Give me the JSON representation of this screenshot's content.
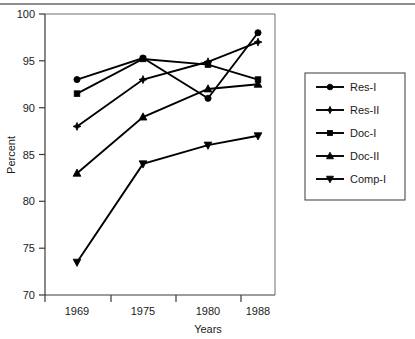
{
  "chart_data": {
    "type": "line",
    "title": "",
    "xlabel": "Years",
    "ylabel": "Percent",
    "categories": [
      "1969",
      "1975",
      "1980",
      "1988"
    ],
    "ylim": [
      70,
      100
    ],
    "yticks": [
      70,
      75,
      80,
      85,
      90,
      95,
      100
    ],
    "grid": false,
    "legend_position": "right-outside",
    "series": [
      {
        "name": "Res-I",
        "marker": "circle",
        "values": [
          93.0,
          95.3,
          91.0,
          98.0
        ]
      },
      {
        "name": "Res-II",
        "marker": "star",
        "values": [
          88.0,
          93.0,
          94.9,
          97.0
        ]
      },
      {
        "name": "Doc-I",
        "marker": "square",
        "values": [
          91.5,
          95.2,
          94.6,
          93.0
        ]
      },
      {
        "name": "Doc-II",
        "marker": "triangle-up",
        "values": [
          83.0,
          89.0,
          92.0,
          92.5
        ]
      },
      {
        "name": "Comp-I",
        "marker": "triangle-down",
        "values": [
          73.5,
          84.0,
          86.0,
          87.0
        ]
      }
    ]
  },
  "axes": {
    "ylabel": "Percent",
    "xlabel": "Years",
    "ytick_labels": [
      "100",
      "95",
      "90",
      "85",
      "80",
      "75",
      "70"
    ],
    "xtick_labels": [
      "1969",
      "1975",
      "1980",
      "1988"
    ]
  },
  "legend": {
    "entries": [
      {
        "label": "Res-I"
      },
      {
        "label": "Res-II"
      },
      {
        "label": "Doc-I"
      },
      {
        "label": "Doc-II"
      },
      {
        "label": "Comp-I"
      }
    ]
  },
  "colors": {
    "series": "#000000",
    "axis": "#3a3a3a",
    "frame": "#6f6f6f",
    "background": "#ffffff",
    "topbar": "#8d8d8d"
  }
}
